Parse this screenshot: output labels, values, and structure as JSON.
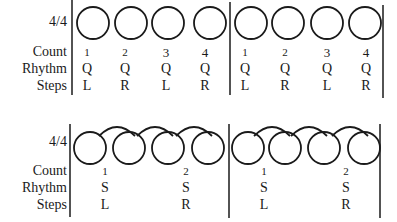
{
  "diagrams": [
    {
      "id": "quick-quick",
      "time_signature": "4/4",
      "row_labels": {
        "count": "Count",
        "rhythm": "Rhythm",
        "steps": "Steps"
      },
      "beats": [
        {
          "count": "1",
          "rhythm": "Q",
          "step": "L"
        },
        {
          "count": "2",
          "rhythm": "Q",
          "step": "R"
        },
        {
          "count": "3",
          "rhythm": "Q",
          "step": "L"
        },
        {
          "count": "4",
          "rhythm": "Q",
          "step": "R"
        },
        {
          "count": "1",
          "rhythm": "Q",
          "step": "L"
        },
        {
          "count": "2",
          "rhythm": "Q",
          "step": "R"
        },
        {
          "count": "3",
          "rhythm": "Q",
          "step": "L"
        },
        {
          "count": "4",
          "rhythm": "Q",
          "step": "R"
        }
      ]
    },
    {
      "id": "slow-slow",
      "time_signature": "4/4",
      "row_labels": {
        "count": "Count",
        "rhythm": "Rhythm",
        "steps": "Steps"
      },
      "beats": [
        {
          "count": "1",
          "rhythm": "S",
          "step": "L"
        },
        {
          "count": "2",
          "rhythm": "S",
          "step": "R"
        },
        {
          "count": "1",
          "rhythm": "S",
          "step": "L"
        },
        {
          "count": "2",
          "rhythm": "S",
          "step": "R"
        }
      ]
    }
  ]
}
